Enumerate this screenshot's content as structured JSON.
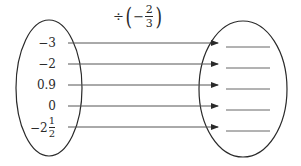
{
  "diagram": {
    "operation": {
      "symbol": "÷",
      "sign": "−",
      "numerator": "2",
      "denominator": "3",
      "open_paren": "(",
      "close_paren": ")"
    },
    "inputs": [
      {
        "label": "−3"
      },
      {
        "label": "−2"
      },
      {
        "label": "0.9"
      },
      {
        "label": "0"
      },
      {
        "whole": "−2",
        "numerator": "1",
        "denominator": "2"
      }
    ],
    "outputs": [
      "",
      "",
      "",
      "",
      ""
    ],
    "colors": {
      "stroke": "#2a2a2a",
      "arrow": "#555555",
      "blank": "#666666"
    }
  }
}
